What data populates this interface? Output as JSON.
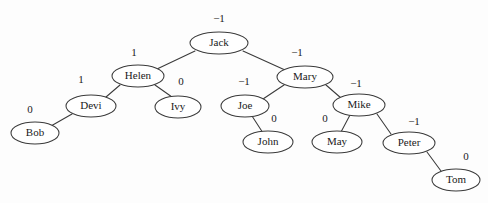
{
  "figure": {
    "kind": "binary-search-tree-diagram",
    "title": "",
    "background_color": "#fdfdfd",
    "stroke_color": "#3a3a3a",
    "text_color": "#1a1a1a"
  },
  "chart_data": {
    "type": "diagram",
    "title": "",
    "nodes": [
      {
        "id": "jack",
        "label": "Jack",
        "balance": "−1",
        "x": 219,
        "y": 43,
        "rx": 29,
        "ry": 11,
        "balance_x": 219,
        "balance_y": 19
      },
      {
        "id": "helen",
        "label": "Helen",
        "balance": "1",
        "x": 138,
        "y": 76,
        "rx": 26,
        "ry": 11,
        "balance_x": 134,
        "balance_y": 53
      },
      {
        "id": "mary",
        "label": "Mary",
        "balance": "−1",
        "x": 305,
        "y": 77,
        "rx": 28,
        "ry": 11,
        "balance_x": 297,
        "balance_y": 53
      },
      {
        "id": "devi",
        "label": "Devi",
        "balance": "1",
        "x": 91,
        "y": 106,
        "rx": 25,
        "ry": 11,
        "balance_x": 81,
        "balance_y": 80
      },
      {
        "id": "ivy",
        "label": "Ivy",
        "balance": "0",
        "x": 178,
        "y": 107,
        "rx": 23,
        "ry": 11,
        "balance_x": 181,
        "balance_y": 82
      },
      {
        "id": "joe",
        "label": "Joe",
        "balance": "−1",
        "x": 245,
        "y": 106,
        "rx": 24,
        "ry": 11,
        "balance_x": 244,
        "balance_y": 82
      },
      {
        "id": "mike",
        "label": "Mike",
        "balance": "−1",
        "x": 359,
        "y": 105,
        "rx": 26,
        "ry": 11,
        "balance_x": 356,
        "balance_y": 84
      },
      {
        "id": "bob",
        "label": "Bob",
        "balance": "0",
        "x": 35,
        "y": 133,
        "rx": 24,
        "ry": 11,
        "balance_x": 30,
        "balance_y": 110
      },
      {
        "id": "john",
        "label": "John",
        "balance": "0",
        "x": 268,
        "y": 142,
        "rx": 25,
        "ry": 11,
        "balance_x": 274,
        "balance_y": 119
      },
      {
        "id": "may",
        "label": "May",
        "balance": "0",
        "x": 337,
        "y": 142,
        "rx": 25,
        "ry": 11,
        "balance_x": 325,
        "balance_y": 119
      },
      {
        "id": "peter",
        "label": "Peter",
        "balance": "−1",
        "x": 409,
        "y": 143,
        "rx": 26,
        "ry": 11,
        "balance_x": 414,
        "balance_y": 122
      },
      {
        "id": "tom",
        "label": "Tom",
        "balance": "0",
        "x": 456,
        "y": 180,
        "rx": 24,
        "ry": 11,
        "balance_x": 466,
        "balance_y": 157
      }
    ],
    "edges": [
      {
        "from": "jack",
        "to": "helen",
        "x1": 195,
        "y1": 51,
        "x2": 157,
        "y2": 69
      },
      {
        "from": "jack",
        "to": "mary",
        "x1": 243,
        "y1": 51,
        "x2": 285,
        "y2": 70
      },
      {
        "from": "helen",
        "to": "devi",
        "x1": 120,
        "y1": 85,
        "x2": 106,
        "y2": 97
      },
      {
        "from": "helen",
        "to": "ivy",
        "x1": 155,
        "y1": 85,
        "x2": 172,
        "y2": 97
      },
      {
        "from": "devi",
        "to": "bob",
        "x1": 72,
        "y1": 114,
        "x2": 51,
        "y2": 126
      },
      {
        "from": "mary",
        "to": "joe",
        "x1": 284,
        "y1": 85,
        "x2": 263,
        "y2": 99
      },
      {
        "from": "mary",
        "to": "mike",
        "x1": 326,
        "y1": 85,
        "x2": 341,
        "y2": 98
      },
      {
        "from": "joe",
        "to": "john",
        "x1": 252,
        "y1": 116,
        "x2": 263,
        "y2": 133
      },
      {
        "from": "mike",
        "to": "may",
        "x1": 350,
        "y1": 115,
        "x2": 341,
        "y2": 132
      },
      {
        "from": "mike",
        "to": "peter",
        "x1": 377,
        "y1": 114,
        "x2": 391,
        "y2": 134
      },
      {
        "from": "peter",
        "to": "tom",
        "x1": 427,
        "y1": 152,
        "x2": 441,
        "y2": 171
      }
    ]
  }
}
